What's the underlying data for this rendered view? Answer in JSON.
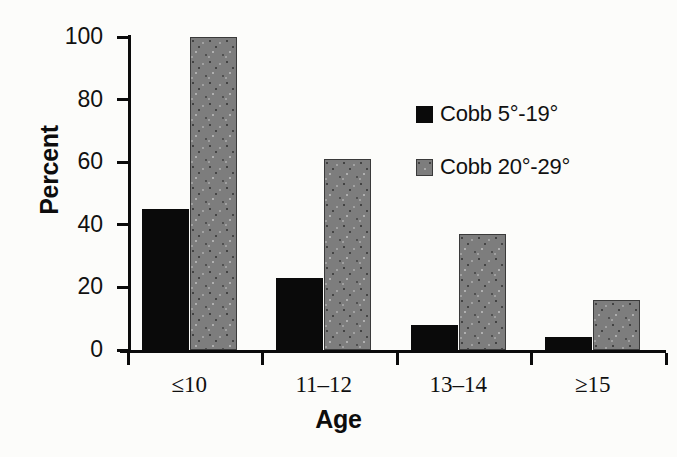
{
  "chart_data": {
    "type": "bar",
    "title": "",
    "subtitle": "",
    "xlabel": "Age",
    "ylabel": "Percent",
    "categories": [
      "≤10",
      "11–12",
      "13–14",
      "≥15"
    ],
    "series": [
      {
        "name": "Cobb 5°-19°",
        "color": "#0a0a0a",
        "fill": "solid-black",
        "values": [
          45,
          23,
          8,
          4
        ]
      },
      {
        "name": "Cobb 20°-29°",
        "color": "#7d7d7d",
        "fill": "gray-stippled",
        "values": [
          100,
          61,
          37,
          16
        ]
      }
    ],
    "ylim": [
      0,
      100
    ],
    "yticks": [
      0,
      20,
      40,
      60,
      80,
      100
    ],
    "ytick_labels": [
      "0",
      "20",
      "40",
      "60",
      "80",
      "100"
    ],
    "grid": false,
    "legend_position": "upper-right-inside",
    "background_color": "#fcfcfa",
    "axis_color": "#0b0b0b"
  },
  "legend": {
    "entries": [
      {
        "label": "Cobb 5°-19°",
        "swatch": "black-square-swatch"
      },
      {
        "label": "Cobb 20°-29°",
        "swatch": "gray-stippled-square-swatch"
      }
    ]
  },
  "axes": {
    "y_title": "Percent",
    "x_title": "Age"
  }
}
